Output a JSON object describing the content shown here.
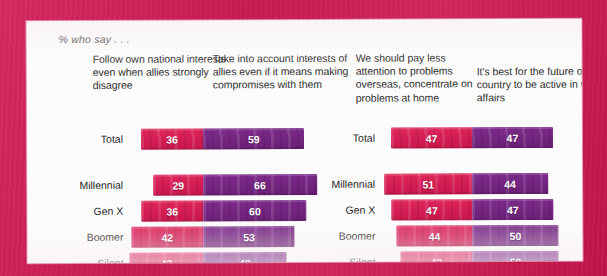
{
  "subtitle": "% who say . . .",
  "colors": {
    "border": "#cf1f55",
    "card": "#fdfcfc",
    "pink": "#d41d54",
    "purple": "#742680",
    "label_text": "#1f1f1f"
  },
  "charts": [
    {
      "id": "chart-left",
      "left_header": "Follow own national interests even when allies strongly disagree",
      "right_header": "Take into account interests of allies even if it means making compromises with them",
      "rows": [
        {
          "label": "Total",
          "left": 36,
          "right": 59
        },
        {
          "label": "Millennial",
          "left": 29,
          "right": 66
        },
        {
          "label": "Gen X",
          "left": 36,
          "right": 60
        },
        {
          "label": "Boomer",
          "left": 42,
          "right": 53
        },
        {
          "label": "Silent",
          "left": 43,
          "right": 48
        }
      ]
    },
    {
      "id": "chart-right",
      "left_header": "We should pay less attention to problems overseas, concentrate on problems at home",
      "right_header": "It's best for the future of our country to be active in world affairs",
      "rows": [
        {
          "label": "Total",
          "left": 47,
          "right": 47
        },
        {
          "label": "Millennial",
          "left": 51,
          "right": 44
        },
        {
          "label": "Gen X",
          "left": 47,
          "right": 47
        },
        {
          "label": "Boomer",
          "left": 44,
          "right": 50
        },
        {
          "label": "Silent",
          "left": 42,
          "right": 50
        }
      ]
    }
  ],
  "chart_data": {
    "type": "bar",
    "title": "",
    "subtitle": "% who say . . .",
    "orientation": "horizontal",
    "layout": "diverging-stacked",
    "xlabel": "",
    "ylabel": "",
    "grid": false,
    "legend_position": "column-headers",
    "panels": [
      {
        "name": "Allies vs. own national interests",
        "categories": [
          "Total",
          "Millennial",
          "Gen X",
          "Boomer",
          "Silent"
        ],
        "series": [
          {
            "name": "Follow own national interests even when allies strongly disagree",
            "color": "#d41d54",
            "direction": "left",
            "values": [
              36,
              29,
              36,
              42,
              43
            ]
          },
          {
            "name": "Take into account interests of allies even if it means making compromises with them",
            "color": "#742680",
            "direction": "right",
            "values": [
              59,
              66,
              60,
              53,
              48
            ]
          }
        ]
      },
      {
        "name": "Problems at home vs. active in world affairs",
        "categories": [
          "Total",
          "Millennial",
          "Gen X",
          "Boomer",
          "Silent"
        ],
        "series": [
          {
            "name": "We should pay less attention to problems overseas, concentrate on problems at home",
            "color": "#d41d54",
            "direction": "left",
            "values": [
              47,
              51,
              47,
              44,
              42
            ]
          },
          {
            "name": "It's best for the future of our country to be active in world affairs",
            "color": "#742680",
            "direction": "right",
            "values": [
              47,
              44,
              47,
              50,
              50
            ]
          }
        ]
      }
    ]
  }
}
